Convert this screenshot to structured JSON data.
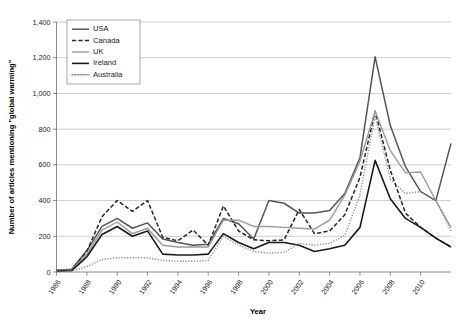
{
  "chart_data": {
    "type": "line",
    "title": "",
    "xlabel": "Year",
    "ylabel": "Number of articles mentioning \"global warming\"",
    "xlim": [
      1986,
      2012
    ],
    "ylim": [
      0,
      1400
    ],
    "ytick_step": 200,
    "xtick_step": 2,
    "grid": "horizontal",
    "legend_position": "top-left-inside",
    "x": [
      1986,
      1987,
      1988,
      1989,
      1990,
      1991,
      1992,
      1993,
      1994,
      1995,
      1996,
      1997,
      1998,
      1999,
      2000,
      2001,
      2002,
      2003,
      2004,
      2005,
      2006,
      2007,
      2008,
      2009,
      2010,
      2011,
      2012
    ],
    "categories": [
      "1986",
      "1987",
      "1988",
      "1989",
      "1990",
      "1991",
      "1992",
      "1993",
      "1994",
      "1995",
      "1996",
      "1997",
      "1998",
      "1999",
      "2000",
      "2001",
      "2002",
      "2003",
      "2004",
      "2005",
      "2006",
      "2007",
      "2008",
      "2009",
      "2010",
      "2011",
      "2012"
    ],
    "xtick_labels": [
      "1986",
      "1988",
      "1990",
      "1992",
      "1994",
      "1996",
      "1998",
      "2000",
      "2002",
      "2004",
      "2006",
      "2008",
      "2010"
    ],
    "ytick_labels": [
      "0",
      "200",
      "400",
      "600",
      "800",
      "1,000",
      "1,200",
      "1,400"
    ],
    "series": [
      {
        "name": "USA",
        "style": "solid",
        "color": "#555555",
        "width": 1.5,
        "values": [
          10,
          15,
          120,
          255,
          300,
          245,
          275,
          185,
          165,
          150,
          155,
          300,
          270,
          185,
          400,
          385,
          330,
          330,
          345,
          440,
          640,
          1205,
          820,
          590,
          450,
          400,
          720
        ]
      },
      {
        "name": "Canada",
        "style": "dashed",
        "color": "#262626",
        "width": 1.5,
        "values": [
          8,
          12,
          115,
          310,
          400,
          340,
          400,
          195,
          175,
          235,
          150,
          370,
          230,
          180,
          175,
          180,
          350,
          215,
          230,
          320,
          530,
          900,
          570,
          330,
          250,
          190,
          140
        ]
      },
      {
        "name": "UK",
        "style": "solid",
        "color": "#9a9a9a",
        "width": 1.4,
        "values": [
          8,
          12,
          100,
          235,
          280,
          215,
          245,
          150,
          140,
          140,
          140,
          290,
          290,
          255,
          255,
          250,
          245,
          240,
          290,
          430,
          620,
          900,
          680,
          555,
          560,
          400,
          250
        ]
      },
      {
        "name": "Ireland",
        "style": "solid",
        "color": "#1a1a1a",
        "width": 1.6,
        "values": [
          5,
          8,
          85,
          210,
          255,
          200,
          230,
          100,
          95,
          95,
          100,
          215,
          165,
          130,
          165,
          165,
          150,
          115,
          130,
          150,
          250,
          625,
          410,
          300,
          250,
          190,
          140
        ]
      },
      {
        "name": "Australia",
        "style": "dotted",
        "color": "#8a8a8a",
        "width": 1.4,
        "values": [
          4,
          6,
          30,
          70,
          80,
          80,
          80,
          65,
          60,
          60,
          65,
          200,
          150,
          115,
          105,
          110,
          160,
          150,
          160,
          205,
          430,
          875,
          520,
          440,
          450,
          400,
          230
        ]
      }
    ]
  }
}
